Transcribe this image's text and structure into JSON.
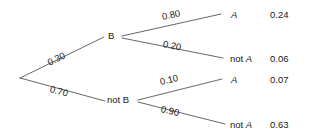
{
  "diagram": {
    "type": "probability-tree",
    "stroke_color": "#555555",
    "text_color": "#1a1a1a",
    "background": "#ffffff",
    "root": {
      "branches": [
        {
          "probability": "0.30",
          "node": "B",
          "branches": [
            {
              "probability": "0.80",
              "outcome": "A",
              "outcome_prefix": "",
              "joint": "0.24"
            },
            {
              "probability": "0.20",
              "outcome": "A",
              "outcome_prefix": "not ",
              "joint": "0.06"
            }
          ]
        },
        {
          "probability": "0.70",
          "node": "not B",
          "branches": [
            {
              "probability": "0.10",
              "outcome": "A",
              "outcome_prefix": "",
              "joint": "0.07"
            },
            {
              "probability": "0.90",
              "outcome": "A",
              "outcome_prefix": "not ",
              "joint": "0.63"
            }
          ]
        }
      ]
    }
  }
}
